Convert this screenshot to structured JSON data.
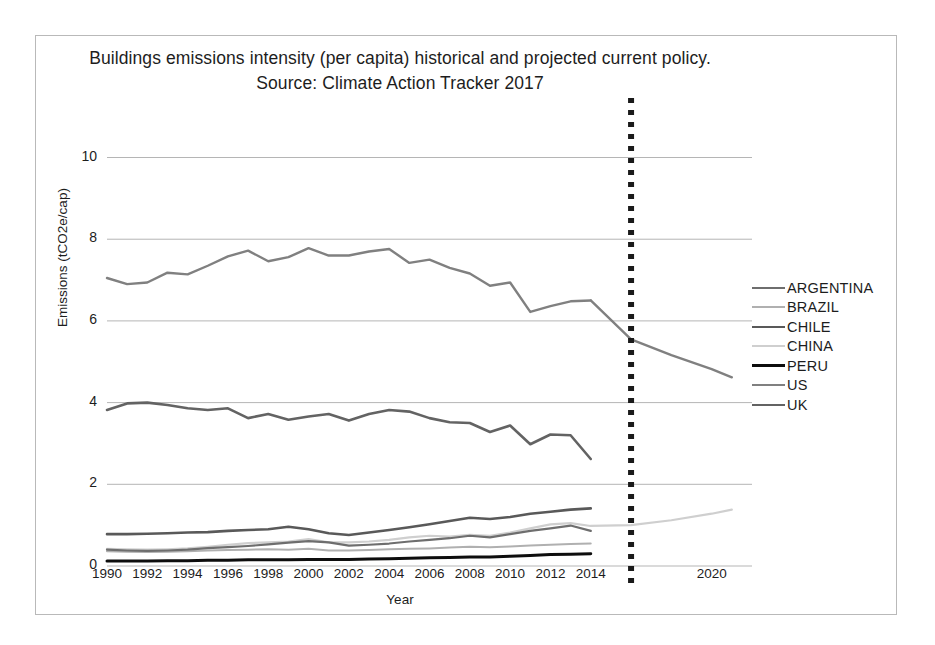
{
  "chart_data": {
    "type": "line",
    "title": "Buildings emissions intensity (per capita) historical and projected current policy.",
    "subtitle": "Source: Climate Action Tracker 2017",
    "xlabel": "Year",
    "ylabel": "Emissions (tCO2e/cap)",
    "xlim": [
      1990,
      2022
    ],
    "ylim": [
      0,
      10.6
    ],
    "yticks": [
      "0",
      "2",
      "4",
      "6",
      "8",
      "10"
    ],
    "ytick_values": [
      0,
      2,
      4,
      6,
      8,
      10
    ],
    "xticks": [
      "1990",
      "1992",
      "1994",
      "1996",
      "1998",
      "2000",
      "2002",
      "2004",
      "2006",
      "2008",
      "2010",
      "2012",
      "2014",
      "2020"
    ],
    "xtick_values": [
      1990,
      1992,
      1994,
      1996,
      1998,
      2000,
      2002,
      2004,
      2006,
      2008,
      2010,
      2012,
      2014,
      2020
    ],
    "grid": "horizontal",
    "legend_position": "right",
    "projection_divider": {
      "label": "projection-divider",
      "year": 2016,
      "style": "dotted",
      "color": "#1a1a1a"
    },
    "x": [
      1990,
      1991,
      1992,
      1993,
      1994,
      1995,
      1996,
      1997,
      1998,
      1999,
      2000,
      2001,
      2002,
      2003,
      2004,
      2005,
      2006,
      2007,
      2008,
      2009,
      2010,
      2011,
      2012,
      2013,
      2014
    ],
    "x_projection": [
      2014,
      2016,
      2018,
      2020,
      2021
    ],
    "series": [
      {
        "name": "ARGENTINA",
        "color": "#6e6e6e",
        "width": 2.2,
        "values": [
          0.4,
          0.38,
          0.37,
          0.38,
          0.4,
          0.44,
          0.46,
          0.49,
          0.53,
          0.57,
          0.61,
          0.58,
          0.5,
          0.52,
          0.55,
          0.6,
          0.64,
          0.68,
          0.74,
          0.7,
          0.78,
          0.86,
          0.92,
          0.99,
          0.86
        ],
        "projection": null
      },
      {
        "name": "BRAZIL",
        "color": "#b0b0b0",
        "width": 2.0,
        "values": [
          0.36,
          0.35,
          0.34,
          0.35,
          0.36,
          0.38,
          0.39,
          0.4,
          0.41,
          0.4,
          0.42,
          0.38,
          0.38,
          0.39,
          0.41,
          0.42,
          0.43,
          0.45,
          0.47,
          0.46,
          0.48,
          0.5,
          0.52,
          0.54,
          0.55
        ],
        "projection": null
      },
      {
        "name": "CHILE",
        "color": "#595959",
        "width": 2.6,
        "values": [
          0.78,
          0.78,
          0.79,
          0.8,
          0.82,
          0.83,
          0.86,
          0.88,
          0.9,
          0.96,
          0.9,
          0.8,
          0.76,
          0.82,
          0.88,
          0.95,
          1.02,
          1.1,
          1.18,
          1.15,
          1.2,
          1.28,
          1.33,
          1.38,
          1.41
        ],
        "projection": null
      },
      {
        "name": "CHINA",
        "color": "#cfcfcf",
        "width": 2.2,
        "values": [
          0.42,
          0.41,
          0.4,
          0.41,
          0.43,
          0.47,
          0.52,
          0.56,
          0.58,
          0.6,
          0.66,
          0.58,
          0.58,
          0.6,
          0.64,
          0.7,
          0.74,
          0.72,
          0.76,
          0.74,
          0.82,
          0.92,
          1.02,
          1.05,
          0.98
        ],
        "projection": [
          0.98,
          1.0,
          1.12,
          1.28,
          1.38
        ]
      },
      {
        "name": "PERU",
        "color": "#0d0d0d",
        "width": 3.0,
        "values": [
          0.12,
          0.12,
          0.12,
          0.13,
          0.13,
          0.14,
          0.14,
          0.15,
          0.15,
          0.15,
          0.16,
          0.16,
          0.16,
          0.17,
          0.18,
          0.19,
          0.2,
          0.21,
          0.22,
          0.22,
          0.24,
          0.26,
          0.28,
          0.29,
          0.3
        ],
        "projection": null
      },
      {
        "name": "US",
        "color": "#808080",
        "width": 2.4,
        "values": [
          7.05,
          6.9,
          6.94,
          7.18,
          7.14,
          7.35,
          7.58,
          7.72,
          7.46,
          7.56,
          7.78,
          7.6,
          7.6,
          7.7,
          7.76,
          7.42,
          7.5,
          7.3,
          7.16,
          6.86,
          6.94,
          6.22,
          6.36,
          6.48,
          6.5
        ],
        "projection": [
          6.5,
          5.55,
          5.16,
          4.82,
          4.62
        ]
      },
      {
        "name": "UK",
        "color": "#636363",
        "width": 2.6,
        "values": [
          3.82,
          3.98,
          4.0,
          3.94,
          3.86,
          3.82,
          3.86,
          3.62,
          3.72,
          3.58,
          3.66,
          3.72,
          3.56,
          3.72,
          3.82,
          3.78,
          3.62,
          3.52,
          3.5,
          3.28,
          3.44,
          2.98,
          3.22,
          3.2,
          2.62
        ],
        "projection": null
      }
    ]
  },
  "legend": {
    "items": [
      {
        "label": "ARGENTINA"
      },
      {
        "label": "BRAZIL"
      },
      {
        "label": "CHILE"
      },
      {
        "label": "CHINA"
      },
      {
        "label": "PERU"
      },
      {
        "label": "US"
      },
      {
        "label": "UK"
      }
    ]
  },
  "colors": {
    "background": "#ffffff",
    "frame": "#b9b9b9",
    "grid": "#b5b5b5",
    "text": "#1d1d1d",
    "divider": "#1a1a1a"
  }
}
